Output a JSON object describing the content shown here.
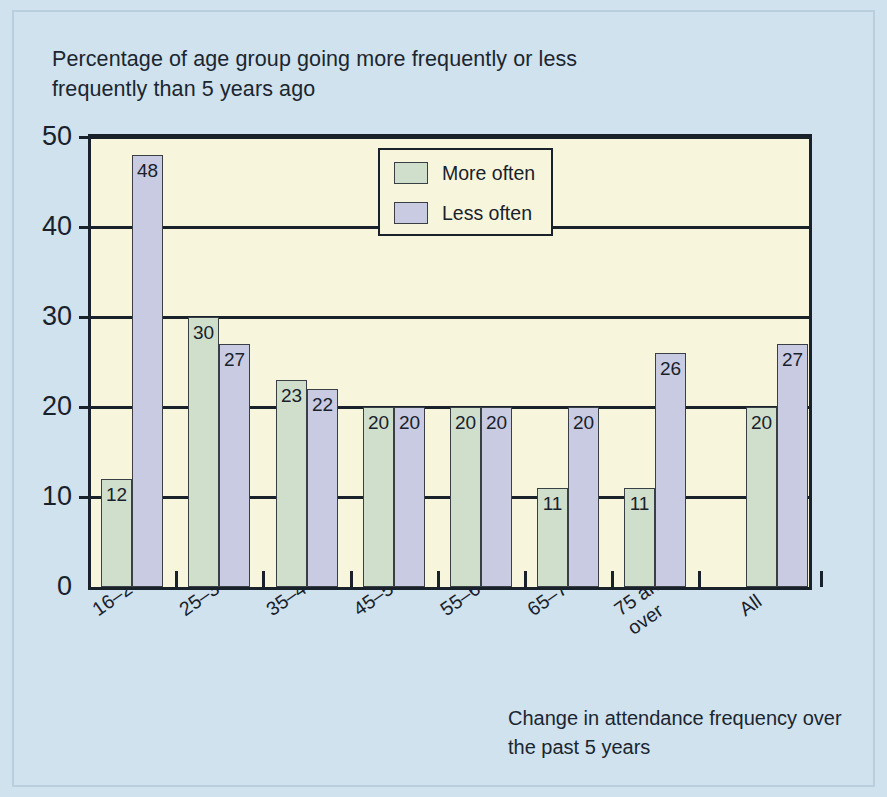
{
  "title": "Percentage of age group going more frequently or less frequently than 5 years ago",
  "caption": "Change in attendance frequency over the past 5 years",
  "legend": {
    "more_label": "More often",
    "less_label": "Less often"
  },
  "colors": {
    "background": "#cfe2ee",
    "plot_background": "#f7f6dd",
    "more_often": "#cfdfcc",
    "less_often": "#c8cbe1",
    "axis": "#19212b"
  },
  "chart_data": {
    "type": "bar",
    "title": "Percentage of age group going more frequently or less frequently than 5 years ago",
    "xlabel": "Change in attendance frequency over the past 5 years",
    "ylabel": "",
    "ylim": [
      0,
      50
    ],
    "yticks": [
      0,
      10,
      20,
      30,
      40,
      50
    ],
    "ytick_labels": [
      "0",
      "10",
      "20",
      "30",
      "40",
      "50"
    ],
    "grid": true,
    "legend_position": "inside-top-center",
    "categories": [
      "16–24",
      "25–34",
      "35–44",
      "45–54",
      "55–64",
      "65–74",
      "75 and\nover",
      "All"
    ],
    "series": [
      {
        "name": "More often",
        "values": [
          12,
          30,
          23,
          20,
          20,
          11,
          11,
          20
        ]
      },
      {
        "name": "Less often",
        "values": [
          48,
          27,
          22,
          20,
          20,
          20,
          26,
          27
        ]
      }
    ]
  }
}
